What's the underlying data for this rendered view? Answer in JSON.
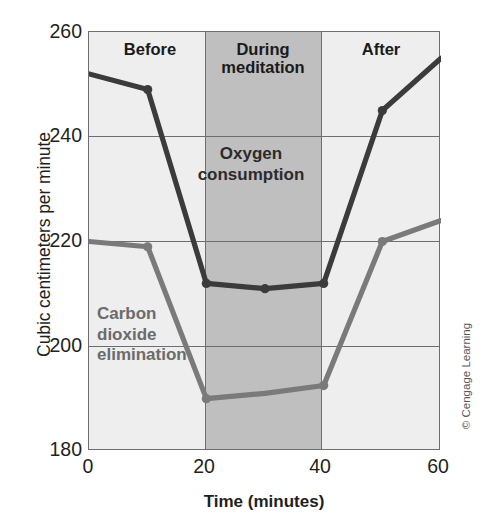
{
  "figure": {
    "copyright": "© Cengage Learning"
  },
  "chart_data": {
    "type": "line",
    "title": "",
    "xlabel": "Time (minutes)",
    "ylabel": "Cubic centimeters per minute",
    "xlim": [
      0,
      60
    ],
    "ylim": [
      180,
      260
    ],
    "xticks": [
      0,
      20,
      40,
      60
    ],
    "xtick_labels": [
      "0",
      "20",
      "40",
      "60"
    ],
    "yticks": [
      180,
      200,
      220,
      240,
      260
    ],
    "ytick_labels": [
      "180",
      "200",
      "220",
      "240",
      "260"
    ],
    "grid": true,
    "legend": "inline-annotations",
    "x": [
      0,
      10,
      20,
      30,
      40,
      50,
      60
    ],
    "series": [
      {
        "name": "Oxygen consumption",
        "color": "#3b3b3b",
        "values": [
          252,
          249,
          212,
          211,
          212,
          245,
          255
        ],
        "markers_at": [
          10,
          20,
          30,
          40,
          50
        ]
      },
      {
        "name": "Carbon dioxide elimination",
        "color": "#7a7a7a",
        "values": [
          220,
          219,
          190,
          191,
          192.5,
          220,
          224
        ],
        "markers_at": [
          10,
          20,
          40,
          50
        ]
      }
    ],
    "bands": [
      {
        "label": "Before",
        "x_start": 0,
        "x_end": 20,
        "shade": "#eeeeee"
      },
      {
        "label": "During meditation",
        "x_start": 20,
        "x_end": 40,
        "shade": "#bfbfbf"
      },
      {
        "label": "After",
        "x_start": 40,
        "x_end": 60,
        "shade": "#eeeeee"
      }
    ],
    "annotations": [
      {
        "name": "oxygen-label",
        "text": "Oxygen\nconsumption"
      },
      {
        "name": "co2-label",
        "text": "Carbon\ndioxide\nelimination"
      }
    ]
  },
  "labels": {
    "phase_before": "Before",
    "phase_during_line1": "During",
    "phase_during_line2": "meditation",
    "phase_after": "After",
    "oxygen_line1": "Oxygen",
    "oxygen_line2": "consumption",
    "co2_line1": "Carbon",
    "co2_line2": "dioxide",
    "co2_line3": "elimination"
  }
}
